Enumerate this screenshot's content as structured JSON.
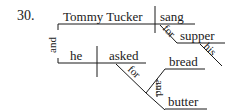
{
  "exercise_number": "30.",
  "clause1": {
    "subject": "Tommy Tucker",
    "verb": "sang",
    "prep_phrase": {
      "preposition": "for",
      "object": "supper",
      "modifier": "his"
    }
  },
  "conjunction": "and",
  "clause2": {
    "subject": "he",
    "verb": "asked",
    "prep_phrase": {
      "preposition": "for",
      "compound_object": {
        "items": [
          "bread",
          "butter"
        ],
        "conjunction": "and"
      }
    }
  },
  "colors": {
    "ink": "#1a1a1a",
    "background": "#ffffff"
  }
}
